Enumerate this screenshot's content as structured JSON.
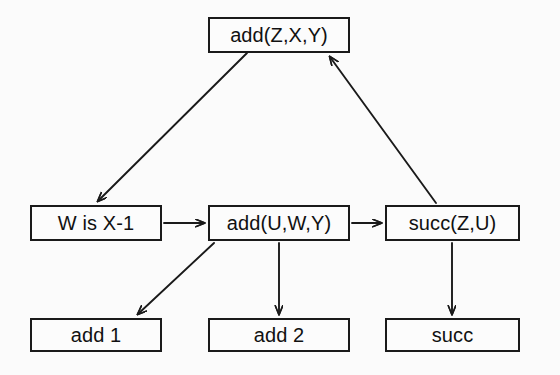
{
  "diagram": {
    "background_color": "#fbfbfb",
    "stroke_color": "#1a1a1a",
    "text_color": "#111111",
    "width": 560,
    "height": 375,
    "nodes": [
      {
        "id": "goal",
        "label": "add(Z,X,Y)",
        "x": 208,
        "y": 17,
        "w": 142,
        "h": 36,
        "font_size": 20
      },
      {
        "id": "w_is_x_minus_1",
        "label": "W is X-1",
        "x": 30,
        "y": 205,
        "w": 132,
        "h": 36,
        "font_size": 20
      },
      {
        "id": "add_uwy",
        "label": "add(U,W,Y)",
        "x": 208,
        "y": 205,
        "w": 142,
        "h": 36,
        "font_size": 20
      },
      {
        "id": "succ_zu",
        "label": "succ(Z,U)",
        "x": 385,
        "y": 205,
        "w": 135,
        "h": 36,
        "font_size": 20
      },
      {
        "id": "add_1",
        "label": "add 1",
        "x": 30,
        "y": 318,
        "w": 132,
        "h": 34,
        "font_size": 20
      },
      {
        "id": "add_2",
        "label": "add 2",
        "x": 208,
        "y": 318,
        "w": 142,
        "h": 34,
        "font_size": 20
      },
      {
        "id": "succ",
        "label": "succ",
        "x": 385,
        "y": 318,
        "w": 135,
        "h": 34,
        "font_size": 20
      }
    ],
    "edges": [
      {
        "id": "goal-to-w",
        "from": "goal",
        "to": "w_is_x_minus_1",
        "label": "",
        "path": "M 247 53 L 98 201",
        "direction": "down-left"
      },
      {
        "id": "succ-to-goal",
        "from": "succ_zu",
        "to": "goal",
        "label": "",
        "path": "M 436 203 L 330 57",
        "direction": "up-left"
      },
      {
        "id": "w-to-adduwy",
        "from": "w_is_x_minus_1",
        "to": "add_uwy",
        "label": "",
        "path": "M 164 223 L 204 223",
        "direction": "right"
      },
      {
        "id": "adduwy-to-succzu",
        "from": "add_uwy",
        "to": "succ_zu",
        "label": "",
        "path": "M 352 223 L 381 223",
        "direction": "right"
      },
      {
        "id": "adduwy-to-add1",
        "from": "add_uwy",
        "to": "add_1",
        "label": "",
        "path": "M 214 243 L 138 314",
        "direction": "down-left"
      },
      {
        "id": "adduwy-to-add2",
        "from": "add_uwy",
        "to": "add_2",
        "label": "",
        "path": "M 279 243 L 279 314",
        "direction": "down"
      },
      {
        "id": "succzu-to-succ",
        "from": "succ_zu",
        "to": "succ",
        "label": "",
        "path": "M 452 243 L 452 314",
        "direction": "down"
      }
    ]
  }
}
